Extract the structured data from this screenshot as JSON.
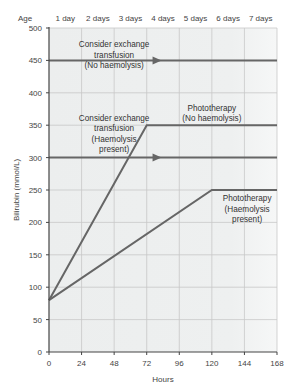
{
  "chart_data": {
    "type": "line",
    "title": "",
    "xlabel": "Hours",
    "ylabel": "Bilirubin (mmol/L)",
    "xlim": [
      0,
      168
    ],
    "ylim": [
      0,
      500
    ],
    "grid": true,
    "x_ticks": [
      0,
      24,
      48,
      72,
      96,
      120,
      144,
      168
    ],
    "y_ticks": [
      0,
      50,
      100,
      150,
      200,
      250,
      300,
      350,
      400,
      450,
      500
    ],
    "top_axis": {
      "label": "Age",
      "ticks": [
        "1 day",
        "2 days",
        "3 days",
        "4 days",
        "5 days",
        "6 days",
        "7 days"
      ]
    },
    "series": [
      {
        "name": "Consider exchange transfusion (No haemolysis)",
        "points": [
          [
            0,
            450
          ],
          [
            168,
            450
          ]
        ],
        "arrow_at": 80,
        "label_lines": [
          "Consider exchange",
          "transfusion",
          "(No haemolysis)"
        ]
      },
      {
        "name": "Consider exchange transfusion (Haemolysis present)",
        "points": [
          [
            0,
            300
          ],
          [
            168,
            300
          ]
        ],
        "arrow_at": 80,
        "label_lines": [
          "Consider exchange",
          "transfusion",
          "(Haemolysis",
          "present)"
        ]
      },
      {
        "name": "Phototherapy (No haemolysis)",
        "points": [
          [
            0,
            80
          ],
          [
            72,
            350
          ],
          [
            168,
            350
          ]
        ],
        "label_lines": [
          "Phototherapy",
          "(No haemolysis)"
        ]
      },
      {
        "name": "Phototherapy (Haemolysis present)",
        "points": [
          [
            0,
            80
          ],
          [
            120,
            250
          ],
          [
            168,
            250
          ]
        ],
        "label_lines": [
          "Phototherapy",
          "(Haemolysis",
          "present)"
        ]
      }
    ],
    "colors": {
      "line": "#666666",
      "grid": "#c8c8c8",
      "plot_bg": "#eef0f0",
      "axis": "#444444"
    }
  }
}
